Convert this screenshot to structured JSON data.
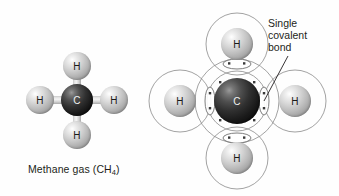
{
  "figure": {
    "background_color": "#fefefe"
  },
  "left_model": {
    "name": "ball-and-stick-model",
    "caption_text": "Methane gas (CH",
    "caption_subscript": "4",
    "caption_suffix": ")",
    "caption_full": "Methane gas (CH4)",
    "center_atom": {
      "symbol": "C",
      "element": "carbon",
      "color": "#1a1a1a",
      "cx": 77,
      "cy": 100,
      "r": 16
    },
    "outer_atoms": [
      {
        "symbol": "H",
        "element": "hydrogen",
        "position": "top",
        "color": "#bdbdbd",
        "cx": 77,
        "cy": 66,
        "r": 14
      },
      {
        "symbol": "H",
        "element": "hydrogen",
        "position": "left",
        "color": "#bdbdbd",
        "cx": 40,
        "cy": 100,
        "r": 14
      },
      {
        "symbol": "H",
        "element": "hydrogen",
        "position": "right",
        "color": "#bdbdbd",
        "cx": 114,
        "cy": 100,
        "r": 14
      },
      {
        "symbol": "H",
        "element": "hydrogen",
        "position": "bottom",
        "color": "#bdbdbd",
        "cx": 77,
        "cy": 135,
        "r": 14
      }
    ],
    "bond_count": 4,
    "bond_color": "#d5d5d5"
  },
  "right_model": {
    "name": "covalent-bond-diagram",
    "annotation_lines": [
      "Single",
      "covalent",
      "bond"
    ],
    "annotation_full": "Single covalent bond",
    "center_atom": {
      "symbol": "C",
      "element": "carbon",
      "color": "#1a1a1a",
      "cx": 237,
      "cy": 101,
      "r": 23,
      "shell_radius": 42
    },
    "outer_atoms": [
      {
        "symbol": "H",
        "element": "hydrogen",
        "position": "top",
        "color": "#bdbdbd",
        "cx": 237,
        "cy": 44,
        "r": 16,
        "shell_radius": 31
      },
      {
        "symbol": "H",
        "element": "hydrogen",
        "position": "left",
        "color": "#bdbdbd",
        "cx": 180,
        "cy": 101,
        "r": 16,
        "shell_radius": 31
      },
      {
        "symbol": "H",
        "element": "hydrogen",
        "position": "right",
        "color": "#bdbdbd",
        "cx": 295,
        "cy": 101,
        "r": 16,
        "shell_radius": 31
      },
      {
        "symbol": "H",
        "element": "hydrogen",
        "position": "bottom",
        "color": "#bdbdbd",
        "cx": 237,
        "cy": 158,
        "r": 16,
        "shell_radius": 31
      }
    ],
    "bond_count": 4,
    "electrons_per_bond": 2,
    "shell_line_color": "#8a8a8a",
    "leader_line": {
      "from_x": 288,
      "from_y": 56,
      "to_x": 263,
      "to_y": 101
    }
  }
}
